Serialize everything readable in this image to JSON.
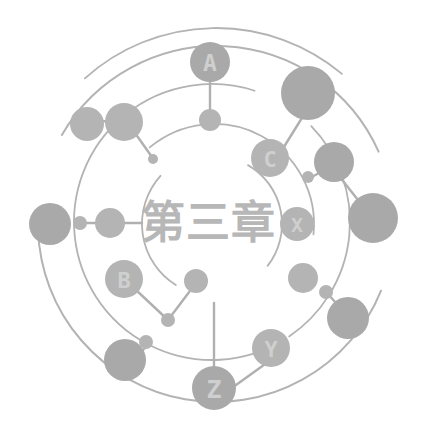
{
  "canvas": {
    "width": 432,
    "height": 448,
    "background": "#ffffff"
  },
  "palette": {
    "node_fill": "#a9a9a9",
    "node_fill_light": "#b4b4b4",
    "edge_stroke": "#b0b0b0",
    "arc_stroke": "#b3b3b3",
    "label_text": "#cfcfcf",
    "title_text": "#b7b7b7"
  },
  "center": {
    "title": "第三章",
    "x": 208,
    "y": 222,
    "font_size": 44
  },
  "arcs": [
    {
      "name": "outer-ring-left",
      "cx": 216,
      "cy": 224,
      "r": 178,
      "start": 112,
      "end": 268,
      "stroke": "#b3b3b3",
      "width": 2.0
    },
    {
      "name": "outer-ring-right",
      "cx": 216,
      "cy": 224,
      "r": 178,
      "start": 300,
      "end": 66,
      "stroke": "#b3b3b3",
      "width": 2.0
    },
    {
      "name": "mid-ring-upper",
      "cx": 212,
      "cy": 222,
      "r": 138,
      "start": 150,
      "end": 18,
      "stroke": "#b3b3b3",
      "width": 1.8
    },
    {
      "name": "mid-ring-lower",
      "cx": 212,
      "cy": 222,
      "r": 138,
      "start": 46,
      "end": 146,
      "stroke": "#b3b3b3",
      "width": 1.8
    },
    {
      "name": "inner-ring-right",
      "cx": 214,
      "cy": 224,
      "r": 100,
      "start": 320,
      "end": 96,
      "stroke": "#b3b3b3",
      "width": 1.8
    },
    {
      "name": "inner-spiral-top",
      "cx": 214,
      "cy": 224,
      "r": 72,
      "start": 212,
      "end": 312,
      "stroke": "#b3b3b3",
      "width": 1.8
    },
    {
      "name": "inner-spiral-bot",
      "cx": 214,
      "cy": 224,
      "r": 68,
      "start": 30,
      "end": 128,
      "stroke": "#b3b3b3",
      "width": 1.8
    },
    {
      "name": "outer-arc-far-right",
      "cx": 216,
      "cy": 224,
      "r": 196,
      "start": 318,
      "end": 40,
      "stroke": "#b3b3b3",
      "width": 1.8
    }
  ],
  "edges": [
    {
      "name": "edge-a-to-a-sub",
      "x1": 210,
      "y1": 82,
      "x2": 210,
      "y2": 116
    },
    {
      "name": "edge-upperleft-to-node",
      "x1": 94,
      "y1": 120,
      "x2": 128,
      "y2": 124
    },
    {
      "name": "edge-node-to-dot",
      "x1": 130,
      "y1": 126,
      "x2": 152,
      "y2": 157
    },
    {
      "name": "edge-left-dot-vertical",
      "x1": 80,
      "y1": 222,
      "x2": 80,
      "y2": 222
    },
    {
      "name": "edge-left-to-center",
      "x1": 82,
      "y1": 223,
      "x2": 112,
      "y2": 223
    },
    {
      "name": "edge-center-to-title",
      "x1": 112,
      "y1": 223,
      "x2": 142,
      "y2": 223
    },
    {
      "name": "edge-b-to-mid-dot",
      "x1": 136,
      "y1": 290,
      "x2": 168,
      "y2": 320
    },
    {
      "name": "edge-mid-dot-to-hub",
      "x1": 168,
      "y1": 320,
      "x2": 196,
      "y2": 283
    },
    {
      "name": "edge-c-to-bigright",
      "x1": 282,
      "y1": 150,
      "x2": 310,
      "y2": 105
    },
    {
      "name": "edge-right-dot-to-node",
      "x1": 310,
      "y1": 178,
      "x2": 330,
      "y2": 167
    },
    {
      "name": "edge-bigright-down",
      "x1": 332,
      "y1": 167,
      "x2": 358,
      "y2": 200
    },
    {
      "name": "edge-rightdot-to-big",
      "x1": 327,
      "y1": 293,
      "x2": 345,
      "y2": 313
    },
    {
      "name": "edge-bottomleft-dot",
      "x1": 125,
      "y1": 368,
      "x2": 145,
      "y2": 348
    },
    {
      "name": "edge-z-vertical",
      "x1": 214,
      "y1": 303,
      "x2": 214,
      "y2": 378
    },
    {
      "name": "edge-z-to-y-arc",
      "x1": 236,
      "y1": 385,
      "x2": 268,
      "y2": 362
    }
  ],
  "nodes": [
    {
      "name": "node-a",
      "label": "A",
      "cx": 210,
      "cy": 62,
      "r": 20,
      "labeled": true
    },
    {
      "name": "node-a-sub",
      "label": "",
      "cx": 210,
      "cy": 120,
      "r": 11,
      "labeled": false
    },
    {
      "name": "node-upper-left-outer",
      "label": "",
      "cx": 87,
      "cy": 124,
      "r": 17,
      "labeled": false
    },
    {
      "name": "node-upper-left-inner",
      "label": "",
      "cx": 124,
      "cy": 122,
      "r": 19,
      "labeled": false
    },
    {
      "name": "node-upper-left-dot",
      "label": "",
      "cx": 153,
      "cy": 159,
      "r": 5,
      "labeled": false
    },
    {
      "name": "node-left-big",
      "label": "",
      "cx": 50,
      "cy": 224,
      "r": 21,
      "labeled": false
    },
    {
      "name": "node-left-dot",
      "label": "",
      "cx": 80,
      "cy": 223,
      "r": 7,
      "labeled": false
    },
    {
      "name": "node-left-mid",
      "label": "",
      "cx": 110,
      "cy": 223,
      "r": 15,
      "labeled": false
    },
    {
      "name": "node-b",
      "label": "B",
      "cx": 124,
      "cy": 279,
      "r": 19,
      "labeled": true
    },
    {
      "name": "node-b-dot",
      "label": "",
      "cx": 168,
      "cy": 320,
      "r": 7,
      "labeled": false
    },
    {
      "name": "node-hub-mid",
      "label": "",
      "cx": 196,
      "cy": 281,
      "r": 12,
      "labeled": false
    },
    {
      "name": "node-bottom-left",
      "label": "",
      "cx": 125,
      "cy": 360,
      "r": 21,
      "labeled": false
    },
    {
      "name": "node-bottom-left-dot",
      "label": "",
      "cx": 146,
      "cy": 342,
      "r": 7,
      "labeled": false
    },
    {
      "name": "node-c",
      "label": "C",
      "cx": 270,
      "cy": 158,
      "r": 19,
      "labeled": true
    },
    {
      "name": "node-top-right-big",
      "label": "",
      "cx": 308,
      "cy": 93,
      "r": 27,
      "labeled": false
    },
    {
      "name": "node-right-upper",
      "label": "",
      "cx": 334,
      "cy": 162,
      "r": 20,
      "labeled": false
    },
    {
      "name": "node-right-small-dot",
      "label": "",
      "cx": 308,
      "cy": 177,
      "r": 6,
      "labeled": false
    },
    {
      "name": "node-right-largest",
      "label": "",
      "cx": 373,
      "cy": 218,
      "r": 25,
      "labeled": false
    },
    {
      "name": "node-x",
      "label": "X",
      "cx": 297,
      "cy": 224,
      "r": 17,
      "labeled": true
    },
    {
      "name": "node-right-mid",
      "label": "",
      "cx": 303,
      "cy": 278,
      "r": 15,
      "labeled": false
    },
    {
      "name": "node-right-dot2",
      "label": "",
      "cx": 326,
      "cy": 292,
      "r": 7,
      "labeled": false
    },
    {
      "name": "node-right-lower",
      "label": "",
      "cx": 348,
      "cy": 318,
      "r": 21,
      "labeled": false
    },
    {
      "name": "node-y",
      "label": "Y",
      "cx": 271,
      "cy": 348,
      "r": 19,
      "labeled": true
    },
    {
      "name": "node-z",
      "label": "Z",
      "cx": 214,
      "cy": 388,
      "r": 22,
      "labeled": true
    }
  ],
  "accessibility": {
    "figure_role": "decorative chapter-opener network diagram",
    "alt": "Abstract gray network diagram of concentric arcs and connected circular nodes labeled A, B, C, X, Y and Z surrounding the heading 第三章"
  }
}
